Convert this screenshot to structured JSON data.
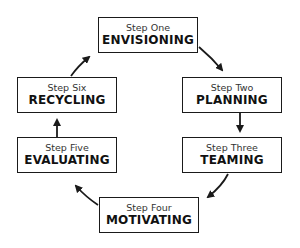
{
  "diagram": {
    "type": "cycle",
    "steps": [
      {
        "step": "Step One",
        "name": "ENVISIONING"
      },
      {
        "step": "Step Two",
        "name": "PLANNING"
      },
      {
        "step": "Step Three",
        "name": "TEAMING"
      },
      {
        "step": "Step Four",
        "name": "MOTIVATING"
      },
      {
        "step": "Step Five",
        "name": "EVALUATING"
      },
      {
        "step": "Step Six",
        "name": "RECYCLING"
      }
    ],
    "flow": [
      "ENVISIONING→PLANNING",
      "PLANNING→TEAMING",
      "TEAMING→MOTIVATING",
      "MOTIVATING→EVALUATING",
      "EVALUATING→RECYCLING",
      "RECYCLING→ENVISIONING"
    ],
    "colors": {
      "line": "#1a1a1a",
      "background": "#ffffff"
    }
  }
}
